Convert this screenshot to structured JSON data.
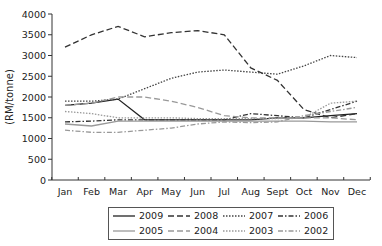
{
  "chart_data": {
    "type": "line",
    "title": "",
    "xlabel": "",
    "ylabel": "(RM/tonne)",
    "ylim": [
      0,
      4000
    ],
    "yticks": [
      0,
      500,
      1000,
      1500,
      2000,
      2500,
      3000,
      3500,
      4000
    ],
    "grid": false,
    "legend_position": "bottom",
    "categories": [
      "Jan",
      "Feb",
      "Mar",
      "Apr",
      "May",
      "Jun",
      "Jul",
      "Aug",
      "Sept",
      "Oct",
      "Nov",
      "Dec"
    ],
    "series": [
      {
        "name": "2009",
        "style": "solid",
        "color": "#222222",
        "values": [
          1800,
          1850,
          1950,
          1450,
          1450,
          1450,
          1450,
          1450,
          1500,
          1500,
          1550,
          1600
        ]
      },
      {
        "name": "2008",
        "style": "dashed",
        "color": "#333333",
        "values": [
          3200,
          3500,
          3700,
          3450,
          3550,
          3600,
          3500,
          2700,
          2400,
          1700,
          1500,
          1600
        ]
      },
      {
        "name": "2007",
        "style": "dotted",
        "color": "#444444",
        "values": [
          1900,
          1900,
          1950,
          2200,
          2450,
          2600,
          2650,
          2600,
          2550,
          2750,
          3000,
          2950
        ]
      },
      {
        "name": "2006",
        "style": "dashdot",
        "color": "#333333",
        "values": [
          1400,
          1420,
          1450,
          1450,
          1450,
          1450,
          1450,
          1600,
          1550,
          1500,
          1700,
          1900
        ]
      },
      {
        "name": "2005",
        "style": "solid",
        "color": "#999999",
        "values": [
          1350,
          1300,
          1420,
          1420,
          1420,
          1420,
          1420,
          1420,
          1420,
          1420,
          1400,
          1400
        ]
      },
      {
        "name": "2004",
        "style": "dashed",
        "color": "#999999",
        "values": [
          1800,
          1850,
          2000,
          2000,
          1900,
          1750,
          1550,
          1500,
          1500,
          1500,
          1500,
          1450
        ]
      },
      {
        "name": "2003",
        "style": "dotted",
        "color": "#999999",
        "values": [
          1650,
          1600,
          1500,
          1500,
          1500,
          1480,
          1480,
          1480,
          1480,
          1500,
          1850,
          1900
        ]
      },
      {
        "name": "2002",
        "style": "dashdot",
        "color": "#999999",
        "values": [
          1200,
          1150,
          1150,
          1200,
          1250,
          1350,
          1400,
          1380,
          1400,
          1550,
          1650,
          1750
        ]
      }
    ]
  },
  "legend": {
    "items": [
      {
        "label": "2009"
      },
      {
        "label": "2008"
      },
      {
        "label": "2007"
      },
      {
        "label": "2006"
      },
      {
        "label": "2005"
      },
      {
        "label": "2004"
      },
      {
        "label": "2003"
      },
      {
        "label": "2002"
      }
    ]
  }
}
